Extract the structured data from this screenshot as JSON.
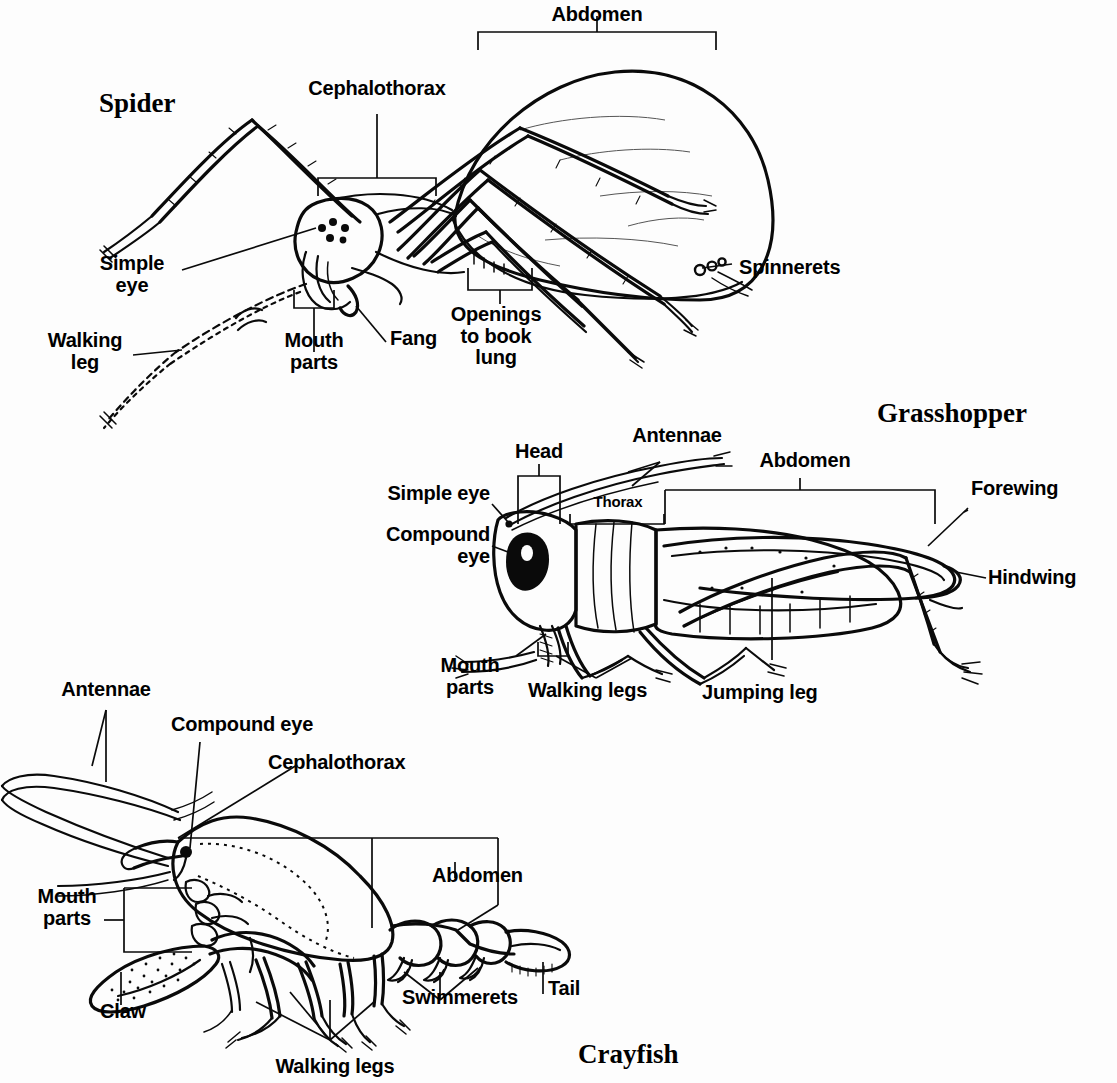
{
  "figure": {
    "kind": "arthropod-anatomy-diagram",
    "background_color": "#fdfdfd",
    "ink_color": "#0a0a0a"
  },
  "panels": [
    {
      "id": "spider",
      "title": "Spider",
      "labels": [
        {
          "name": "cephalothorax",
          "text": "Cephalothorax"
        },
        {
          "name": "abdomen",
          "text": "Abdomen"
        },
        {
          "name": "simple-eye",
          "text": "Simple\neye"
        },
        {
          "name": "walking-leg",
          "text": "Walking\nleg"
        },
        {
          "name": "mouth-parts",
          "text": "Mouth\nparts"
        },
        {
          "name": "fang",
          "text": "Fang"
        },
        {
          "name": "openings-to-book-lung",
          "text": "Openings\nto book\nlung"
        },
        {
          "name": "spinnerets",
          "text": "Spinnerets"
        }
      ]
    },
    {
      "id": "grasshopper",
      "title": "Grasshopper",
      "labels": [
        {
          "name": "head",
          "text": "Head"
        },
        {
          "name": "antennae",
          "text": "Antennae"
        },
        {
          "name": "abdomen",
          "text": "Abdomen"
        },
        {
          "name": "thorax",
          "text": "Thorax"
        },
        {
          "name": "simple-eye",
          "text": "Simple eye"
        },
        {
          "name": "compound-eye",
          "text": "Compound\neye"
        },
        {
          "name": "forewing",
          "text": "Forewing"
        },
        {
          "name": "hindwing",
          "text": "Hindwing"
        },
        {
          "name": "mouth-parts",
          "text": "Mouth\nparts"
        },
        {
          "name": "walking-legs",
          "text": "Walking legs"
        },
        {
          "name": "jumping-leg",
          "text": "Jumping leg"
        }
      ]
    },
    {
      "id": "crayfish",
      "title": "Crayfish",
      "labels": [
        {
          "name": "antennae",
          "text": "Antennae"
        },
        {
          "name": "compound-eye",
          "text": "Compound eye"
        },
        {
          "name": "cephalothorax",
          "text": "Cephalothorax"
        },
        {
          "name": "abdomen",
          "text": "Abdomen"
        },
        {
          "name": "mouth-parts",
          "text": "Mouth\nparts"
        },
        {
          "name": "claw",
          "text": "Claw"
        },
        {
          "name": "walking-legs",
          "text": "Walking legs"
        },
        {
          "name": "swimmerets",
          "text": "Swimmerets"
        },
        {
          "name": "tail",
          "text": "Tail"
        }
      ]
    }
  ],
  "spider": {
    "title": "Spider",
    "cephalothorax": "Cephalothorax",
    "abdomen": "Abdomen",
    "simple_eye": "Simple\neye",
    "walking_leg": "Walking\nleg",
    "mouth_parts": "Mouth\nparts",
    "fang": "Fang",
    "book_lung": "Openings\nto book\nlung",
    "spinnerets": "Spinnerets"
  },
  "grasshopper": {
    "title": "Grasshopper",
    "head": "Head",
    "antennae": "Antennae",
    "abdomen": "Abdomen",
    "thorax": "Thorax",
    "simple_eye": "Simple eye",
    "compound_eye": "Compound\neye",
    "forewing": "Forewing",
    "hindwing": "Hindwing",
    "mouth_parts": "Mouth\nparts",
    "walking_legs": "Walking legs",
    "jumping_leg": "Jumping leg"
  },
  "crayfish": {
    "title": "Crayfish",
    "antennae": "Antennae",
    "compound_eye": "Compound eye",
    "cephalothorax": "Cephalothorax",
    "abdomen": "Abdomen",
    "mouth_parts": "Mouth\nparts",
    "claw": "Claw",
    "walking_legs": "Walking legs",
    "swimmerets": "Swimmerets",
    "tail": "Tail"
  }
}
